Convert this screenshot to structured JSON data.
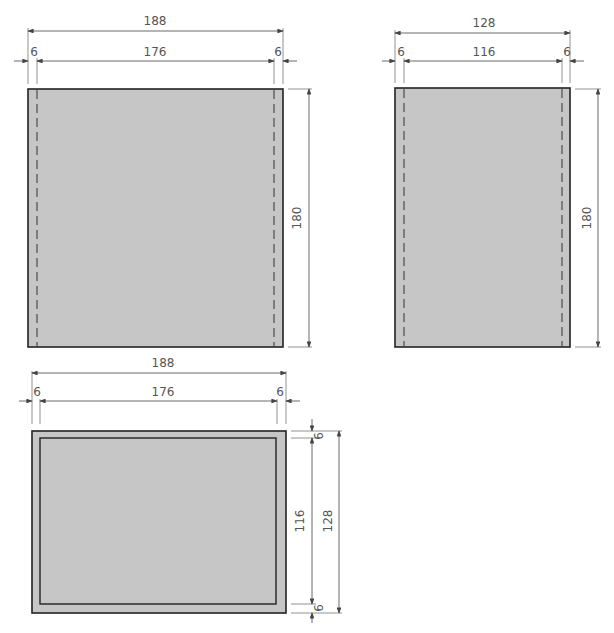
{
  "drawing": {
    "views": [
      {
        "name": "front-view",
        "dims": {
          "overall_width": "188",
          "inner_width": "176",
          "left_offset": "6",
          "right_offset": "6",
          "height": "180"
        }
      },
      {
        "name": "side-view",
        "dims": {
          "overall_width": "128",
          "inner_width": "116",
          "left_offset": "6",
          "right_offset": "6",
          "height": "180"
        }
      },
      {
        "name": "top-view",
        "dims": {
          "overall_width": "188",
          "inner_width": "176",
          "left_offset": "6",
          "right_offset": "6",
          "inner_depth": "116",
          "overall_depth": "128",
          "top_offset": "6",
          "bottom_offset": "6"
        }
      }
    ],
    "colors": {
      "fill": "#c6c6c6",
      "outline": "#222222",
      "dimension": "#555555"
    }
  }
}
